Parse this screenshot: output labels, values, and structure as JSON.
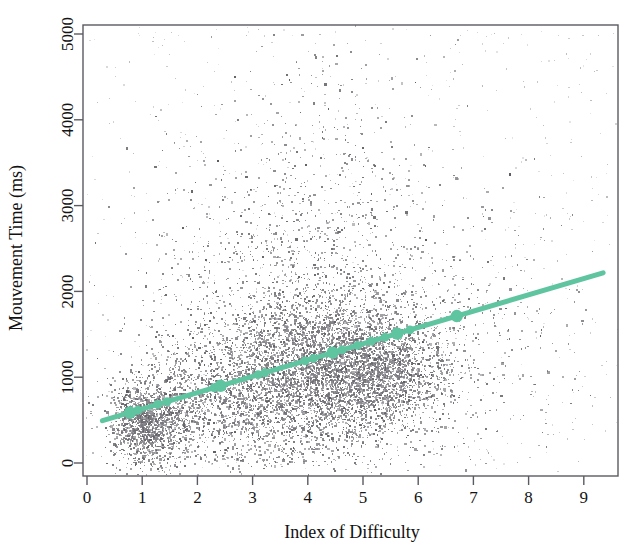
{
  "chart_data": {
    "type": "scatter",
    "title": "",
    "xlabel": "Index of Difficulty",
    "ylabel": "Mouvement Time (ms)",
    "xlim": [
      0.0,
      9.35
    ],
    "ylim": [
      -180,
      5200
    ],
    "xticks": [
      0,
      1,
      2,
      3,
      4,
      5,
      6,
      7,
      8,
      9
    ],
    "xtick_labels": [
      "0",
      "1",
      "2",
      "3",
      "4",
      "5",
      "6",
      "7",
      "8",
      "9"
    ],
    "yticks": [
      0,
      1000,
      2000,
      3000,
      4000,
      5000
    ],
    "ytick_labels": [
      "0",
      "1000",
      "2000",
      "3000",
      "4000",
      "5000"
    ],
    "grid": false,
    "legend": false,
    "frame": "box",
    "point_color": "#6c6c74",
    "point_size": 1.6,
    "point_count": 9000,
    "series": [
      {
        "name": "trials",
        "type": "scatter",
        "color": "#6c6c74",
        "description": "Individual movement trials, dense cloud peaking around ID 4-5 and MT 900-1200 ms"
      },
      {
        "name": "fitts-law-regression",
        "type": "line",
        "color": "#5fc4a0",
        "linewidth": 5,
        "intercept_ms": 440,
        "slope_ms_per_bit": 190,
        "x_start": 0.28,
        "x_end": 9.35,
        "y_start": 493,
        "y_end": 2217
      },
      {
        "name": "condition-means",
        "type": "marker",
        "color": "#5fc4a0",
        "marker": "circle",
        "points": [
          {
            "x": 0.78,
            "y": 588
          },
          {
            "x": 0.92,
            "y": 615
          },
          {
            "x": 1.28,
            "y": 683
          },
          {
            "x": 1.45,
            "y": 716
          },
          {
            "x": 2.3,
            "y": 877
          },
          {
            "x": 2.42,
            "y": 900
          },
          {
            "x": 3.1,
            "y": 1029
          },
          {
            "x": 3.22,
            "y": 1052
          },
          {
            "x": 3.95,
            "y": 1190
          },
          {
            "x": 4.1,
            "y": 1219
          },
          {
            "x": 4.45,
            "y": 1286
          },
          {
            "x": 4.62,
            "y": 1318
          },
          {
            "x": 4.9,
            "y": 1371
          },
          {
            "x": 5.15,
            "y": 1419
          },
          {
            "x": 5.4,
            "y": 1466
          },
          {
            "x": 5.62,
            "y": 1508
          },
          {
            "x": 5.85,
            "y": 1552
          },
          {
            "x": 6.7,
            "y": 1713
          }
        ]
      }
    ],
    "cloud_clusters": [
      {
        "cx": 1.05,
        "cy": 430,
        "sx": 0.3,
        "sy": 210,
        "n": 900
      },
      {
        "cx": 1.35,
        "cy": 560,
        "sx": 0.45,
        "sy": 330,
        "n": 700
      },
      {
        "cx": 2.6,
        "cy": 820,
        "sx": 0.7,
        "sy": 420,
        "n": 900
      },
      {
        "cx": 3.6,
        "cy": 1000,
        "sx": 0.75,
        "sy": 470,
        "n": 1400
      },
      {
        "cx": 4.4,
        "cy": 1070,
        "sx": 0.8,
        "sy": 430,
        "n": 1700
      },
      {
        "cx": 5.05,
        "cy": 1080,
        "sx": 0.75,
        "sy": 400,
        "n": 1300
      },
      {
        "cx": 5.6,
        "cy": 1010,
        "sx": 0.55,
        "sy": 330,
        "n": 700
      },
      {
        "cx": 4.1,
        "cy": 1850,
        "sx": 1.2,
        "sy": 700,
        "n": 850
      },
      {
        "cx": 4.2,
        "cy": 2900,
        "sx": 1.3,
        "sy": 800,
        "n": 350
      },
      {
        "cx": 4.3,
        "cy": 4000,
        "sx": 1.4,
        "sy": 700,
        "n": 140
      },
      {
        "cx": 6.6,
        "cy": 1400,
        "sx": 1.0,
        "sy": 700,
        "n": 260
      },
      {
        "cx": 7.6,
        "cy": 1500,
        "sx": 1.0,
        "sy": 800,
        "n": 110
      },
      {
        "cx": 2.1,
        "cy": 1800,
        "sx": 0.9,
        "sy": 800,
        "n": 160
      },
      {
        "cx": 3.0,
        "cy": 70,
        "sx": 1.1,
        "sy": 60,
        "n": 70
      }
    ]
  },
  "plot_geometry": {
    "frame_left": 83,
    "frame_right": 618,
    "frame_top": 25,
    "frame_bottom": 476,
    "x0_px": 87,
    "x_unit_px": 55.2,
    "y0_px": 463,
    "y_per_1000_px": 85.8
  },
  "colors": {
    "accent_green": "#5fc4a0",
    "point_gray": "#6c6c74",
    "axis_gray": "#5a5a62",
    "text_black": "#141414",
    "background": "#ffffff"
  }
}
